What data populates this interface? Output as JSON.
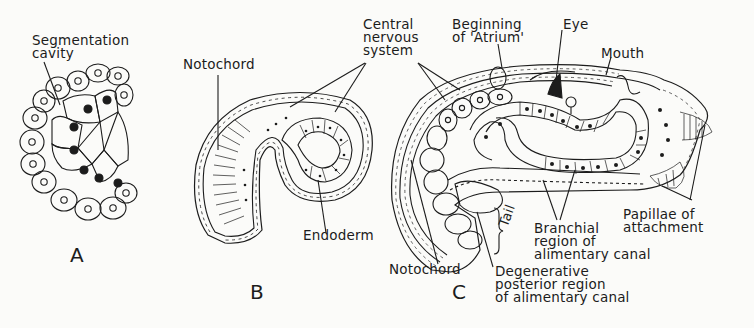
{
  "figure": {
    "panels": [
      {
        "id": "A",
        "letter": "A",
        "labels": {
          "segmentation_cavity": "Segmentation\ncavity"
        }
      },
      {
        "id": "B",
        "letter": "B",
        "labels": {
          "notochord": "Notochord",
          "endoderm": "Endoderm"
        }
      },
      {
        "id": "C",
        "letter": "C",
        "labels": {
          "central_nervous_system": "Central\nnervous\nsystem",
          "beginning_of_atrium": "Beginning\nof 'Atrium'",
          "eye": "Eye",
          "mouth": "Mouth",
          "notochord": "Notochord",
          "tail": "Tail",
          "branchial_region": "Branchial\nregion of\nalimentary canal",
          "papillae_of_attachment": "Papillae of\nattachment",
          "degenerative_posterior_region": "Degenerative\nposterior region\nof alimentary canal"
        }
      }
    ]
  },
  "colors": {
    "ink": "#1c1c1c",
    "paper": "#fbfbf9"
  }
}
